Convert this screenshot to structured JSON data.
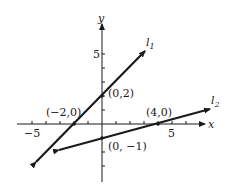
{
  "diagram": {
    "type": "coordinate-plane",
    "axes": {
      "x_label": "x",
      "y_label": "y",
      "x_tick_labels": [
        "−5",
        "5"
      ],
      "y_tick_labels": [
        "5"
      ],
      "x_range": [
        -7,
        7
      ],
      "y_range": [
        -5,
        6
      ]
    },
    "lines": [
      {
        "name": "l1",
        "label_main": "l",
        "label_sub": "1",
        "slope": 1,
        "intercept": 2,
        "points": [
          {
            "label": "(−2,0)",
            "x": -2,
            "y": 0
          },
          {
            "label": "(0,2)",
            "x": 0,
            "y": 2
          }
        ]
      },
      {
        "name": "l2",
        "label_main": "l",
        "label_sub": "2",
        "slope": 0.25,
        "intercept": -1,
        "points": [
          {
            "label": "(4,0)",
            "x": 4,
            "y": 0
          },
          {
            "label": "(0, −1)",
            "x": 0,
            "y": -1
          }
        ]
      }
    ],
    "colors": {
      "ink": "#1a1a1a",
      "background": "#ffffff"
    }
  }
}
